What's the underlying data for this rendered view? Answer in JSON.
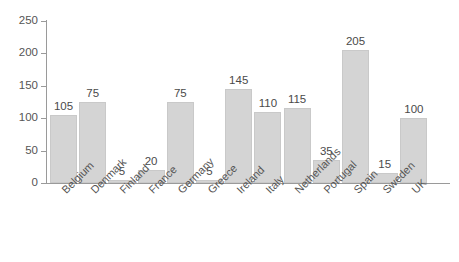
{
  "chart_data": {
    "type": "bar",
    "title": "",
    "subtitle": "",
    "xlabel": "",
    "ylabel": "",
    "ylim": [
      0,
      250
    ],
    "yticks": [
      0,
      50,
      100,
      150,
      200,
      250
    ],
    "grid": false,
    "legend": "none",
    "orientation": "vertical",
    "bar_color": "#d4d4d4",
    "bar_edge_color": "#c9c9c9",
    "axis_color": "#9a9a9a",
    "text_color": "#555555",
    "tick_label_rotation": -45,
    "categories": [
      "Belgium",
      "Denmark",
      "Finland",
      "France",
      "Germany",
      "Greece",
      "Ireland",
      "Italy",
      "Netherlands",
      "Portugal",
      "Spain",
      "Sweden",
      "UK"
    ],
    "values": [
      105,
      125,
      5,
      20,
      125,
      5,
      145,
      110,
      115,
      35,
      205,
      15,
      100
    ],
    "data_labels": [
      "105",
      "75",
      "5",
      "20",
      "75",
      "5",
      "145",
      "110",
      "115",
      "35",
      "205",
      "15",
      "100"
    ],
    "series": [
      {
        "name": "",
        "values": [
          105,
          125,
          5,
          20,
          125,
          5,
          145,
          110,
          115,
          35,
          205,
          15,
          100
        ]
      }
    ]
  }
}
